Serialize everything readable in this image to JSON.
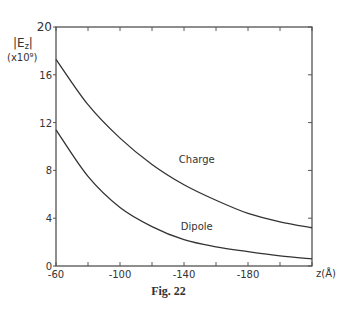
{
  "chart_data": {
    "type": "line",
    "title": "",
    "caption": "Fig. 22",
    "xlabel": "z(Å)",
    "ylabel": "|E_z|",
    "ylabel_line1": "|E",
    "ylabel_sub": "z",
    "ylabel_line2": "(x10⁹)",
    "xlim": [
      -60,
      -220
    ],
    "ylim": [
      0,
      20
    ],
    "x_ticks": [
      -60,
      -80,
      -100,
      -120,
      -140,
      -160,
      -180,
      -200,
      -220
    ],
    "x_tick_labels": [
      "-60",
      "-100",
      "-140",
      "-180"
    ],
    "x_tick_label_values": [
      -60,
      -100,
      -140,
      -180
    ],
    "y_ticks": [
      0,
      4,
      8,
      12,
      16,
      20
    ],
    "y_tick_labels": [
      "0",
      "4",
      "8",
      "12",
      "16",
      "20"
    ],
    "grid": false,
    "legend": "inline labels",
    "x": [
      -60,
      -80,
      -100,
      -120,
      -140,
      -160,
      -180,
      -200,
      -220
    ],
    "series": [
      {
        "name": "Charge",
        "values": [
          17.3,
          13.5,
          10.7,
          8.5,
          6.8,
          5.5,
          4.4,
          3.7,
          3.2
        ]
      },
      {
        "name": "Dipole",
        "values": [
          11.4,
          7.5,
          4.9,
          3.3,
          2.2,
          1.6,
          1.2,
          0.85,
          0.6
        ]
      }
    ],
    "annotations": [
      {
        "text": "Charge",
        "x": -148,
        "y": 8.6
      },
      {
        "text": "Dipole",
        "x": -148,
        "y": 3.0
      }
    ]
  }
}
